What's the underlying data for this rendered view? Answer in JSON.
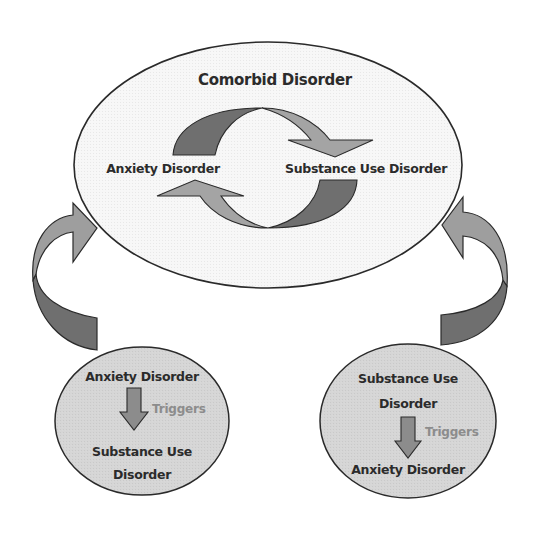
{
  "diagram": {
    "title": "Comorbid Disorder",
    "cycle": {
      "left_node": "Anxiety Disorder",
      "right_node": "Substance Use Disorder"
    },
    "left_pathway": {
      "top_label": "Anxiety Disorder",
      "relation_label": "Triggers",
      "bottom_label_line1": "Substance Use",
      "bottom_label_line2": "Disorder"
    },
    "right_pathway": {
      "top_label_line1": "Substance Use",
      "top_label_line2": "Disorder",
      "relation_label": "Triggers",
      "bottom_label": "Anxiety Disorder"
    },
    "colors": {
      "outline": "#2a2a2a",
      "main_ellipse_fill": "#f7f7f7",
      "small_circle_fill": "#d6d6d6",
      "arrow_light": "#9e9e9e",
      "arrow_dark": "#6f6f6f",
      "triggers_text": "#8c8c8c"
    }
  }
}
